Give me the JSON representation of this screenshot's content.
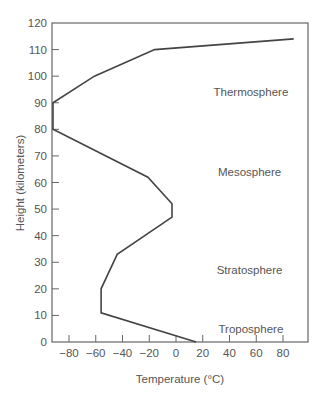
{
  "chart_data": {
    "type": "line",
    "title": "",
    "xlabel": "Temperature (°C)",
    "ylabel": "Height (kilometers)",
    "xlim": [
      -93,
      98
    ],
    "ylim": [
      0,
      120
    ],
    "xticks": [
      -80,
      -60,
      -40,
      -20,
      0,
      20,
      40,
      60,
      80
    ],
    "xtick_labels": [
      "−80",
      "−60",
      "−40",
      "−20",
      "0",
      "20",
      "40",
      "60",
      "80"
    ],
    "yticks": [
      0,
      10,
      20,
      30,
      40,
      50,
      60,
      70,
      80,
      90,
      100,
      110,
      120
    ],
    "ytick_labels": [
      "0",
      "10",
      "20",
      "30",
      "40",
      "50",
      "60",
      "70",
      "80",
      "90",
      "100",
      "110",
      "120"
    ],
    "grid": false,
    "legend": null,
    "series": [
      {
        "name": "Atmospheric temperature profile",
        "points": [
          {
            "temp": 15,
            "height": 0
          },
          {
            "temp": -56,
            "height": 11
          },
          {
            "temp": -56,
            "height": 20
          },
          {
            "temp": -44,
            "height": 33
          },
          {
            "temp": -3,
            "height": 47
          },
          {
            "temp": -3,
            "height": 52
          },
          {
            "temp": -21,
            "height": 62
          },
          {
            "temp": -92,
            "height": 80
          },
          {
            "temp": -92,
            "height": 90
          },
          {
            "temp": -61,
            "height": 100
          },
          {
            "temp": -16,
            "height": 110
          },
          {
            "temp": 88,
            "height": 114
          }
        ]
      }
    ],
    "annotations": [
      {
        "text": "Thermosphere",
        "temp": 56,
        "height": 94
      },
      {
        "text": "Mesosphere",
        "temp": 55,
        "height": 64
      },
      {
        "text": "Stratosphere",
        "temp": 55,
        "height": 27
      },
      {
        "text": "Troposphere",
        "temp": 56,
        "height": 5
      }
    ]
  },
  "colors": {
    "line": "#444444",
    "axis": "#666666",
    "text": "#555555"
  }
}
